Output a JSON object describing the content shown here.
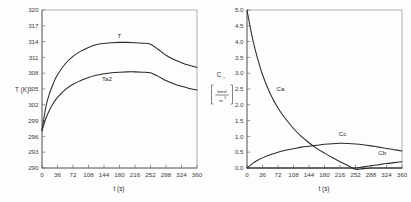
{
  "figure": {
    "title": "",
    "background_color": "#fdfdfd",
    "curve_color": "#2b2b2b",
    "axis_color": "#5c5c5c"
  },
  "chart_data": [
    {
      "type": "line",
      "id": "temperature-chart",
      "title": "",
      "xlabel": "t (s)",
      "ylabel": "T (K)",
      "xlim": [
        0,
        360
      ],
      "ylim": [
        290,
        320
      ],
      "xticks": [
        0,
        36,
        72,
        108,
        144,
        180,
        216,
        252,
        288,
        324,
        360
      ],
      "xtick_labels": [
        "0",
        "36",
        "72",
        "108",
        "144",
        "180",
        "216",
        "252",
        "288",
        "324",
        "360"
      ],
      "yticks": [
        290,
        293,
        296,
        299,
        302,
        305,
        308,
        311,
        314,
        317,
        320
      ],
      "ytick_labels": [
        "290",
        "293",
        "296",
        "299",
        "302",
        "305",
        "308",
        "311",
        "314",
        "317",
        "320"
      ],
      "grid": false,
      "legend_position": "inline-curve-labels",
      "x": [
        0,
        9,
        18,
        27,
        36,
        54,
        72,
        90,
        108,
        126,
        144,
        162,
        180,
        198,
        216,
        234,
        252,
        270,
        288,
        306,
        324,
        342,
        360
      ],
      "series": [
        {
          "name": "T",
          "label": "T",
          "label_x": 180,
          "label_y": 314.6,
          "values": [
            297.1,
            301.6,
            304.3,
            306.2,
            307.7,
            309.8,
            311.2,
            312.2,
            312.9,
            313.4,
            313.65,
            313.8,
            313.85,
            313.85,
            313.8,
            313.7,
            313.5,
            312.5,
            311.4,
            310.6,
            310.0,
            309.5,
            309.1
          ]
        },
        {
          "name": "Ta2",
          "label": "Ta2",
          "label_x": 151,
          "label_y": 306.6,
          "values": [
            297.1,
            299.4,
            301.1,
            302.4,
            303.4,
            304.9,
            305.9,
            306.6,
            307.2,
            307.6,
            307.9,
            308.1,
            308.2,
            308.25,
            308.25,
            308.2,
            308.1,
            307.4,
            306.6,
            306.0,
            305.5,
            305.1,
            304.8
          ]
        }
      ]
    },
    {
      "type": "line",
      "id": "concentration-chart",
      "title": "",
      "xlabel": "t (s)",
      "ylabel": "C",
      "ylabel_subscript": "i",
      "ylabel_units_numerator": "kmol",
      "ylabel_units_denominator": "m",
      "ylabel_units_denominator_exponent": "3",
      "xlim": [
        0,
        360
      ],
      "ylim": [
        0.0,
        5.0
      ],
      "xticks": [
        0,
        36,
        72,
        108,
        144,
        180,
        216,
        252,
        288,
        324,
        360
      ],
      "xtick_labels": [
        "0",
        "36",
        "72",
        "108",
        "144",
        "180",
        "216",
        "252",
        "288",
        "324",
        "360"
      ],
      "yticks": [
        0.0,
        0.5,
        1.0,
        1.5,
        2.0,
        2.5,
        3.0,
        3.5,
        4.0,
        4.5,
        5.0
      ],
      "ytick_labels": [
        "0.0",
        "0.5",
        "1.0",
        "1.5",
        "2.0",
        "2.5",
        "3.0",
        "3.5",
        "4.0",
        "4.5",
        "5.0"
      ],
      "grid": false,
      "legend_position": "inline-curve-labels",
      "x": [
        0,
        9,
        18,
        27,
        36,
        54,
        72,
        90,
        108,
        126,
        144,
        162,
        180,
        198,
        216,
        234,
        252,
        270,
        288,
        306,
        324,
        342,
        360
      ],
      "series": [
        {
          "name": "Ca",
          "label": "Ca",
          "label_x": 78,
          "label_y": 2.45,
          "values": [
            5.0,
            4.35,
            3.8,
            3.35,
            2.95,
            2.35,
            1.9,
            1.55,
            1.25,
            1.0,
            0.8,
            0.62,
            0.47,
            0.33,
            0.2,
            0.08,
            -0.04,
            -0.02,
            0.0,
            0.0,
            0.0,
            0.0,
            0.0
          ]
        },
        {
          "name": "Cc",
          "label": "Cc",
          "label_x": 222,
          "label_y": 1.02,
          "values": [
            0.0,
            0.1,
            0.19,
            0.26,
            0.32,
            0.42,
            0.5,
            0.56,
            0.61,
            0.66,
            0.69,
            0.72,
            0.75,
            0.77,
            0.78,
            0.775,
            0.76,
            0.735,
            0.7,
            0.66,
            0.62,
            0.58,
            0.54
          ]
        },
        {
          "name": "Cb",
          "label": "Cb",
          "label_x": 314,
          "label_y": 0.42,
          "values": [
            0.0,
            0.0,
            0.0,
            0.0,
            0.0,
            0.0,
            0.0,
            0.0,
            0.0,
            0.0,
            0.0,
            0.0,
            0.0,
            0.0,
            0.0,
            0.0,
            0.0,
            0.035,
            0.07,
            0.105,
            0.14,
            0.17,
            0.2
          ]
        }
      ]
    }
  ]
}
